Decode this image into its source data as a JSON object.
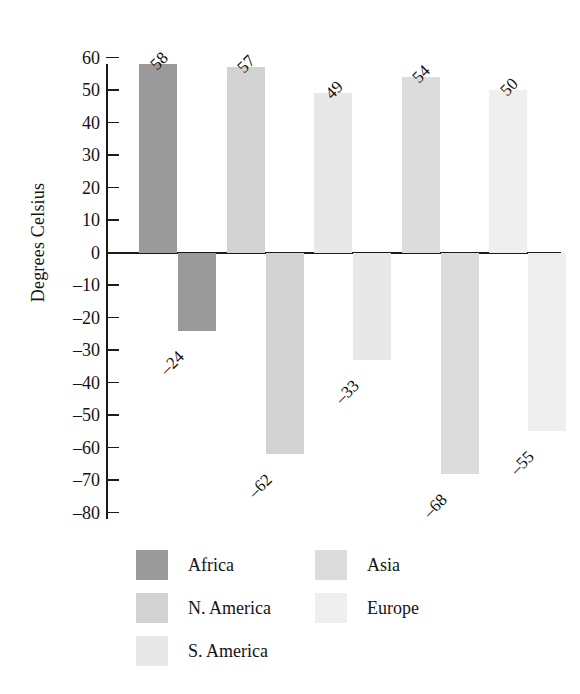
{
  "chart_data": {
    "type": "bar",
    "title": "",
    "xlabel": "",
    "ylabel": "Degrees Celsius",
    "ylim": [
      -80,
      60
    ],
    "grid": false,
    "legend_position": "bottom",
    "y_ticks": [
      60,
      50,
      40,
      30,
      20,
      10,
      0,
      -10,
      -20,
      -30,
      -40,
      -50,
      -60,
      -70,
      -80
    ],
    "y_tick_labels": [
      "60",
      "50",
      "40",
      "30",
      "20",
      "10",
      "0",
      "–10",
      "–20",
      "–30",
      "–40",
      "–50",
      "–60",
      "–70",
      "–80"
    ],
    "categories": [
      "Africa",
      "N. America",
      "S. America",
      "Asia",
      "Europe"
    ],
    "series": [
      {
        "name": "positive",
        "values": [
          58,
          57,
          49,
          54,
          50
        ],
        "labels": [
          "58",
          "57",
          "49",
          "54",
          "50"
        ]
      },
      {
        "name": "negative",
        "values": [
          -24,
          -62,
          -33,
          -68,
          -55
        ],
        "labels": [
          "–24",
          "–62",
          "–33",
          "–68",
          "–55"
        ]
      }
    ],
    "colors": {
      "Africa": "#9a9a9a",
      "N. America": "#d2d2d2",
      "S. America": "#e8e8e8",
      "Asia": "#dcdcdc",
      "Europe": "#efefef"
    },
    "axis_color": "#1b1b1b"
  },
  "axis": {
    "y_title": "Degrees Celsius"
  },
  "legend": {
    "items": [
      {
        "label": "Africa",
        "color": "#9a9a9a"
      },
      {
        "label": "N. America",
        "color": "#d2d2d2"
      },
      {
        "label": "S. America",
        "color": "#e8e8e8"
      },
      {
        "label": "Asia",
        "color": "#dcdcdc"
      },
      {
        "label": "Europe",
        "color": "#efefef"
      }
    ]
  }
}
